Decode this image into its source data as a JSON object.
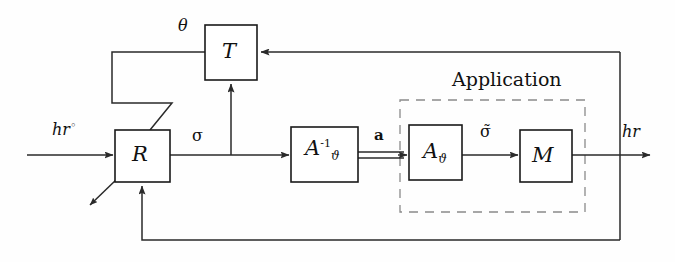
{
  "figure": {
    "type": "block-diagram",
    "title": "",
    "background_color": "#fefefe",
    "line_color": "#2a2a2a",
    "dashed_group_color": "#8a8a8a"
  },
  "blocks": [
    {
      "id": "T",
      "label": "T",
      "symbol": "calligraphic-T",
      "x": 205,
      "y": 25,
      "w": 52,
      "h": 55
    },
    {
      "id": "R",
      "label": "R",
      "symbol": "calligraphic-R",
      "x": 115,
      "y": 130,
      "w": 55,
      "h": 52
    },
    {
      "id": "Ainv",
      "label": "A",
      "superscript": "-1",
      "subscript": "ϑ",
      "symbol": "calligraphic-A-inverse-vartheta",
      "x": 291,
      "y": 127,
      "w": 67,
      "h": 55
    },
    {
      "id": "A",
      "label": "A",
      "subscript": "ϑ",
      "symbol": "calligraphic-A-vartheta",
      "x": 409,
      "y": 125,
      "w": 53,
      "h": 55
    },
    {
      "id": "M",
      "label": "M",
      "symbol": "calligraphic-M",
      "x": 520,
      "y": 130,
      "w": 52,
      "h": 52
    }
  ],
  "group": {
    "label": "Application",
    "x": 400,
    "y": 100,
    "w": 185,
    "h": 112,
    "label_x": 452,
    "label_y": 70
  },
  "signals": [
    {
      "id": "hr_ref",
      "text": "hr",
      "superscript": "◦",
      "x": 52,
      "y": 120,
      "style": "italic"
    },
    {
      "id": "theta",
      "text": "θ",
      "x": 178,
      "y": 18,
      "style": "italic"
    },
    {
      "id": "sigma",
      "text": "σ",
      "x": 192,
      "y": 128,
      "style": "normal"
    },
    {
      "id": "a_vector",
      "text": "a",
      "x": 374,
      "y": 128,
      "style": "bold"
    },
    {
      "id": "sigma_tilde",
      "text": "σ̃",
      "x": 480,
      "y": 126,
      "style": "normal"
    },
    {
      "id": "hr_out",
      "text": "hr",
      "x": 622,
      "y": 124,
      "style": "italic"
    }
  ],
  "wires": [
    {
      "id": "hr-ref-into-R",
      "from": "input",
      "to": "R",
      "arrow": true
    },
    {
      "id": "R-to-Ainv",
      "from": "R",
      "to": "Ainv",
      "label": "sigma",
      "arrow": true
    },
    {
      "id": "sigma-branch-up-to-T",
      "from": "sigma-node",
      "to": "T",
      "arrow": true
    },
    {
      "id": "T-to-R-theta",
      "from": "T",
      "to": "R",
      "label": "theta",
      "arrow": false
    },
    {
      "id": "Ainv-to-A",
      "from": "Ainv",
      "to": "A",
      "label": "a_vector",
      "arrow": true,
      "double_line": true
    },
    {
      "id": "A-to-M",
      "from": "A",
      "to": "M",
      "label": "sigma_tilde",
      "arrow": true
    },
    {
      "id": "M-to-output",
      "from": "M",
      "to": "output",
      "label": "hr_out",
      "arrow": true
    },
    {
      "id": "output-branch-to-T",
      "from": "output-node",
      "to": "T",
      "arrow": true
    },
    {
      "id": "output-branch-to-R",
      "from": "output-node",
      "to": "R",
      "arrow": true
    },
    {
      "id": "R-external-diagonal",
      "from": "R",
      "to": "external",
      "arrow": true
    }
  ]
}
